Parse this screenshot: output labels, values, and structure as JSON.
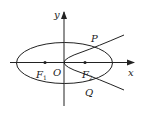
{
  "figure": {
    "type": "ellipse-parabola-intersection",
    "axes": {
      "x_label": "x",
      "y_label": "y",
      "origin_label": "O"
    },
    "ellipse": {
      "foci": [
        {
          "name": "F",
          "sub": "1"
        },
        {
          "name": "F",
          "sub": "2"
        }
      ]
    },
    "parabola": {
      "vertex": "O",
      "opens": "right"
    },
    "intersections": [
      {
        "label": "P"
      },
      {
        "label": "Q"
      }
    ],
    "colors": {
      "stroke": "#222222",
      "background": "#ffffff"
    }
  }
}
